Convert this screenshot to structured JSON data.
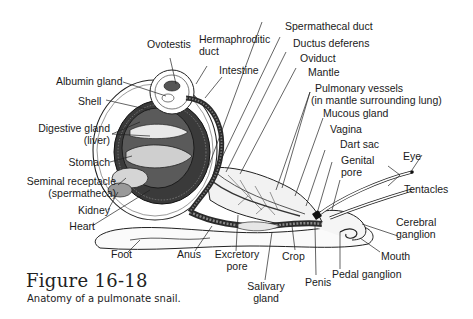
{
  "figure": {
    "title": "Figure 16-18",
    "caption": "Anatomy of a pulmonate snail."
  },
  "labels": {
    "ovotestis": "Ovotestis",
    "hermaphroditic_duct_1": "Hermaphroditic",
    "hermaphroditic_duct_2": "duct",
    "intestine": "Intestine",
    "albumin_gland": "Albumin gland",
    "shell": "Shell",
    "digestive_gland_1": "Digestive gland",
    "digestive_gland_2": "(liver)",
    "stomach": "Stomach",
    "seminal_receptacle_1": "Seminal receptacle",
    "seminal_receptacle_2": "(spermatheca)",
    "kidney": "Kidney",
    "heart": "Heart",
    "foot": "Foot",
    "anus": "Anus",
    "excretory_pore_1": "Excretory",
    "excretory_pore_2": "pore",
    "crop": "Crop",
    "salivary_gland_1": "Salivary",
    "salivary_gland_2": "gland",
    "penis": "Penis",
    "pedal_ganglion": "Pedal ganglion",
    "mouth": "Mouth",
    "cerebral_ganglion_1": "Cerebral",
    "cerebral_ganglion_2": "ganglion",
    "tentacles": "Tentacles",
    "eye": "Eye",
    "genital_pore_1": "Genital",
    "genital_pore_2": "pore",
    "dart_sac": "Dart sac",
    "vagina": "Vagina",
    "mucous_gland": "Mucous gland",
    "pulmonary_vessels_1": "Pulmonary vessels",
    "pulmonary_vessels_2": "(in mantle surrounding lung)",
    "mantle": "Mantle",
    "oviduct": "Oviduct",
    "ductus_deferens": "Ductus deferens",
    "spermathecal_duct": "Spermathecal duct"
  },
  "colors": {
    "ink": "#1a1a1a",
    "dark_organ": "#3a3a3a",
    "mid_organ": "#8a8a8a",
    "light_organ": "#c8c8c8"
  }
}
